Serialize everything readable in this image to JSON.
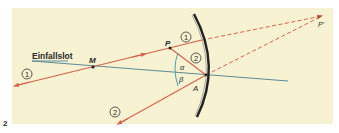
{
  "figure": {
    "number": "2",
    "background_color": "#f6f2d2",
    "ray_color": "#d9604a",
    "normal_color": "#5d8a9a",
    "mirror_color": "#222222",
    "angle_arc_color": "#4aa0b0"
  },
  "labels": {
    "normal": "Einfallslot",
    "center": "M",
    "point": "P",
    "image_point": "P'",
    "incidence_point": "A",
    "angle_incidence": "α",
    "angle_reflection": "β"
  },
  "rays": [
    {
      "id": "1",
      "label": "1",
      "description": "ray through center M, reflected back on itself"
    },
    {
      "id": "2",
      "label": "2",
      "description": "ray from P to A, reflected with angle β = α"
    }
  ]
}
